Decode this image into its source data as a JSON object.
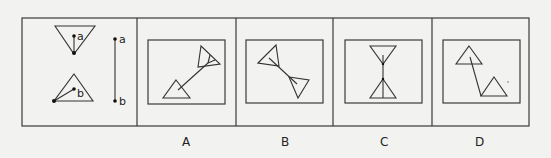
{
  "figure": {
    "type": "spatial-reasoning-puzzle",
    "reference": {
      "top_point_label": "a",
      "bottom_point_label": "b",
      "segment_labels": [
        "a",
        "b"
      ]
    },
    "options": [
      {
        "label": "A"
      },
      {
        "label": "B"
      },
      {
        "label": "C"
      },
      {
        "label": "D"
      }
    ],
    "colors": {
      "background": "#f2f2f0",
      "stroke": "#333333"
    }
  }
}
